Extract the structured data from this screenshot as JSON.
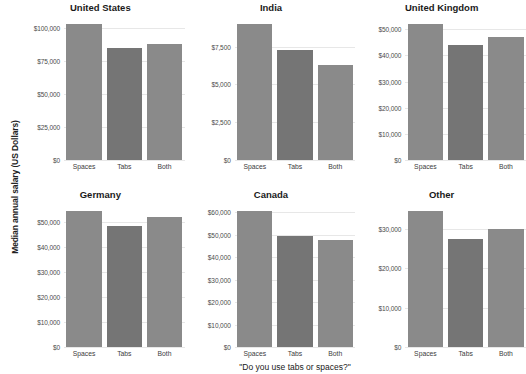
{
  "chart_data": {
    "type": "bar",
    "title": "",
    "xlabel": "\"Do you use tabs or spaces?\"",
    "ylabel": "Median annual salary (US Dollars)",
    "categories": [
      "Spaces",
      "Tabs",
      "Both"
    ],
    "grid": true,
    "legend": "none",
    "facet_layout": {
      "rows": 2,
      "cols": 3
    },
    "colors": {
      "bar": "#8a8a8a",
      "bar_alt": "#757575",
      "gridline": "#e7e7e7",
      "text": "#222222"
    },
    "panels": [
      {
        "title": "United States",
        "values": [
          103000,
          85000,
          88000
        ],
        "ylim": [
          0,
          110000
        ],
        "yticks": [
          0,
          25000,
          50000,
          75000,
          100000
        ],
        "ytick_labels": [
          "$0",
          "$25,000",
          "$50,000",
          "$75,000",
          "$100,000"
        ]
      },
      {
        "title": "India",
        "values": [
          9000,
          7300,
          6300
        ],
        "ylim": [
          0,
          9600
        ],
        "yticks": [
          0,
          2500,
          5000,
          7500
        ],
        "ytick_labels": [
          "$0",
          "$2,500",
          "$5,000",
          "$7,500"
        ]
      },
      {
        "title": "United Kingdom",
        "values": [
          52000,
          44000,
          47000
        ],
        "ylim": [
          0,
          55500
        ],
        "yticks": [
          0,
          10000,
          20000,
          30000,
          40000,
          50000
        ],
        "ytick_labels": [
          "$0",
          "$10,000",
          "$20,000",
          "$30,000",
          "$40,000",
          "$50,000"
        ]
      },
      {
        "title": "Germany",
        "values": [
          54500,
          48500,
          52000
        ],
        "ylim": [
          0,
          58000
        ],
        "yticks": [
          0,
          10000,
          20000,
          30000,
          40000,
          50000
        ],
        "ytick_labels": [
          "$0",
          "$10,000",
          "$20,000",
          "$30,000",
          "$40,000",
          "$50,000"
        ]
      },
      {
        "title": "Canada",
        "values": [
          60500,
          49500,
          47500
        ],
        "ylim": [
          0,
          64500
        ],
        "yticks": [
          0,
          10000,
          20000,
          30000,
          40000,
          50000,
          60000
        ],
        "ytick_labels": [
          "$0",
          "$10,000",
          "$20,000",
          "$30,000",
          "$40,000",
          "$50,000",
          "$60,000"
        ]
      },
      {
        "title": "Other",
        "values": [
          34500,
          27500,
          30000
        ],
        "ylim": [
          0,
          36800
        ],
        "yticks": [
          0,
          10000,
          20000,
          30000
        ],
        "ytick_labels": [
          "$0",
          "$10,000",
          "$20,000",
          "$30,000"
        ]
      }
    ]
  }
}
